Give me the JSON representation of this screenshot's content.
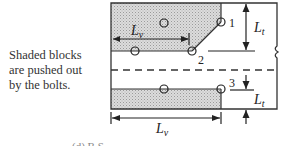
{
  "description": {
    "lines": [
      "Shaded blocks",
      "are pushed out",
      "by the bolts."
    ]
  },
  "diagram": {
    "bolt_labels": [
      "1",
      "2",
      "3"
    ],
    "dimension_labels": {
      "top_lv_main": "L",
      "top_lv_sub": "v",
      "bottom_lv_main": "L",
      "bottom_lv_sub": "v",
      "top_lt_main": "L",
      "top_lt_sub": "t",
      "bottom_lt_main": "L",
      "bottom_lt_sub": "t"
    },
    "colors": {
      "plate_stroke": "#333333",
      "shading": "#cfcfcf",
      "background": "#ffffff"
    }
  },
  "footer": {
    "caption_partial": "(d) B.S. ..."
  }
}
